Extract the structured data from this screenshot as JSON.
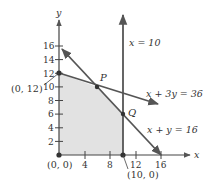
{
  "diagram": {
    "type": "linear-programming-feasible-region",
    "axes": {
      "x_label": "x",
      "y_label": "y",
      "x_ticks": [
        "4",
        "8",
        "12",
        "16"
      ],
      "y_ticks": [
        "2",
        "4",
        "6",
        "8",
        "10",
        "12",
        "14",
        "16"
      ]
    },
    "lines": [
      {
        "equation": "x = 10"
      },
      {
        "equation": "x + 3y = 36"
      },
      {
        "equation": "x + y = 16"
      }
    ],
    "points": [
      {
        "label": "(0, 12)"
      },
      {
        "label": "P"
      },
      {
        "label": "Q"
      },
      {
        "label": "(0, 0)"
      },
      {
        "label": "(10, 0)"
      }
    ],
    "colors": {
      "region_fill": "#e2e2e2",
      "line": "#555555",
      "axis": "#444444",
      "text": "#333333"
    }
  }
}
